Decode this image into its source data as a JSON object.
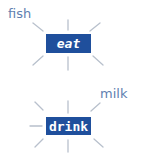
{
  "diagrams": [
    {
      "center_label": "eat",
      "associated_word": "fish",
      "word_position": "top-left"
    },
    {
      "center_label": "drink",
      "associated_word": "milk",
      "word_position": "top-right"
    }
  ],
  "colors": {
    "box": "#1f4f9c",
    "box_text": "#ffffff",
    "word": "#5f7fb0",
    "ray": "#b8c0cc"
  }
}
